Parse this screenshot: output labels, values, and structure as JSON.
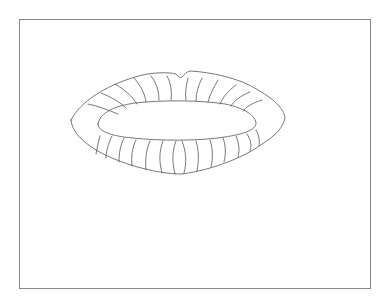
{
  "drawing": {
    "subject": "lips",
    "stroke_color": "#555555",
    "frame_color": "#8a8a8a",
    "background": "#ffffff"
  }
}
